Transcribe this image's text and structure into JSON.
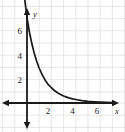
{
  "chart_data": {
    "type": "line",
    "title": "",
    "subtitle": "",
    "xlabel": "x",
    "ylabel": "y",
    "xlim": [
      -1,
      8
    ],
    "ylim": [
      -2,
      8
    ],
    "grid": true,
    "legend": null,
    "x_ticks": [
      2,
      4,
      6
    ],
    "y_ticks": [
      2,
      4,
      6
    ],
    "x_tick_labels": [
      "2",
      "4",
      "6"
    ],
    "y_tick_labels": [
      "2",
      "4",
      "6"
    ],
    "series": [
      {
        "name": "exponential decay",
        "style": "solid",
        "color": "#1a1a1a",
        "x": [
          -0.35,
          -0.2,
          0,
          0.2,
          0.4,
          0.6,
          0.8,
          1.0,
          1.25,
          1.5,
          1.75,
          2.0,
          2.25,
          2.5,
          2.75,
          3.0,
          3.25,
          3.5,
          3.75,
          4.0,
          4.5,
          5.0,
          5.5,
          6.0,
          6.5,
          7.0
        ],
        "y": [
          10.2,
          8.6,
          7.0,
          5.8,
          4.85,
          4.05,
          3.4,
          2.85,
          2.3,
          1.85,
          1.5,
          1.25,
          1.02,
          0.84,
          0.7,
          0.58,
          0.48,
          0.4,
          0.34,
          0.29,
          0.2,
          0.14,
          0.1,
          0.07,
          0.05,
          0.04
        ]
      }
    ],
    "annotations": []
  },
  "axes": {
    "x_axis_label": "x",
    "y_axis_label": "y",
    "x_arrow": "arrow-right",
    "y_arrow_up": "arrow-up",
    "y_arrow_down": "arrow-down"
  },
  "colors": {
    "grid": "#dcdcdc",
    "axis": "#1a1a1a",
    "curve": "#1a1a1a",
    "background": "#ffffff",
    "text": "#1a1a1a"
  }
}
